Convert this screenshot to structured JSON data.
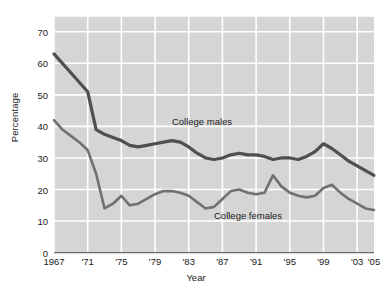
{
  "chart_data": {
    "type": "line",
    "title": "",
    "xlabel": "Year",
    "ylabel": "Percentage",
    "xlim": [
      1967,
      2005
    ],
    "ylim": [
      0,
      75
    ],
    "grid": true,
    "legend_position": "inline-annotations",
    "background_color": "#d5d5d5",
    "gridline_color": "#ffffff",
    "x": [
      1967,
      1968,
      1969,
      1970,
      1971,
      1972,
      1973,
      1974,
      1975,
      1976,
      1977,
      1978,
      1979,
      1980,
      1981,
      1982,
      1983,
      1984,
      1985,
      1986,
      1987,
      1988,
      1989,
      1990,
      1991,
      1992,
      1993,
      1994,
      1995,
      1996,
      1997,
      1998,
      1999,
      2000,
      2001,
      2002,
      2003,
      2004,
      2005
    ],
    "xtick_positions": [
      1967,
      1971,
      1975,
      1979,
      1983,
      1987,
      1991,
      1995,
      1999,
      2003,
      2005
    ],
    "xtick_labels": [
      "1967",
      "'71",
      "'75",
      "'79",
      "'83",
      "'87",
      "'91",
      "'95",
      "'99",
      "'03",
      "'05"
    ],
    "ytick_positions": [
      0,
      10,
      20,
      30,
      40,
      50,
      60,
      70
    ],
    "ytick_labels": [
      "0",
      "10",
      "20",
      "30",
      "40",
      "50",
      "60",
      "70"
    ],
    "series": [
      {
        "name": "College males",
        "color": "#4f4f4f",
        "line_width": 3.2,
        "label_x": 1981,
        "label_y": 41.5,
        "values": [
          63,
          60,
          57,
          54,
          51,
          39,
          37.5,
          36.5,
          35.5,
          34,
          33.5,
          34,
          34.5,
          35,
          35.5,
          35,
          33.5,
          31.5,
          30,
          29.5,
          30,
          31,
          31.5,
          31,
          31,
          30.5,
          29.5,
          30,
          30,
          29.5,
          30.5,
          32,
          34.5,
          33,
          31,
          29,
          27.5,
          26,
          24.5
        ]
      },
      {
        "name": "College females",
        "color": "#717171",
        "line_width": 2.6,
        "label_x": 1986,
        "label_y": 11.5,
        "values": [
          42,
          39,
          37,
          35,
          32.5,
          25,
          14,
          15.5,
          18,
          15,
          15.5,
          17,
          18.5,
          19.5,
          19.5,
          19,
          18,
          16,
          14,
          14.5,
          17,
          19.5,
          20,
          19,
          18.5,
          19,
          24.5,
          21,
          19,
          18,
          17.5,
          18,
          20.5,
          21.5,
          19,
          17,
          15.5,
          14,
          13.5
        ]
      }
    ]
  }
}
